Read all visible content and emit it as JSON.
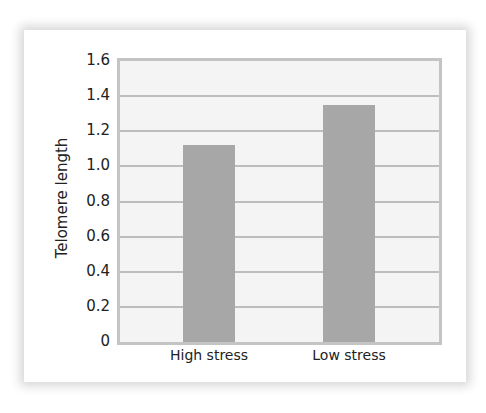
{
  "chart_data": {
    "type": "bar",
    "title": "",
    "xlabel": "",
    "ylabel": "Telomere length",
    "categories": [
      "High stress",
      "Low stress"
    ],
    "values": [
      1.12,
      1.35
    ],
    "ylim": [
      0,
      1.6
    ],
    "yticks": [
      "0",
      "0.2",
      "0.4",
      "0.6",
      "0.8",
      "1.0",
      "1.2",
      "1.4",
      "1.6"
    ],
    "grid": true,
    "legend": null,
    "colors": {
      "bar": "#a7a7a7",
      "plot_bg": "#f4f4f4",
      "grid": "#bdbdbd",
      "frame": "#c4c4c4"
    }
  }
}
